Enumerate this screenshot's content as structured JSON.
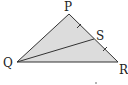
{
  "diagram": {
    "labels": {
      "P": "P",
      "Q": "Q",
      "R": "R",
      "S": "S"
    },
    "points": {
      "P": [
        69,
        14
      ],
      "Q": [
        17,
        62
      ],
      "R": [
        118,
        62
      ],
      "S": [
        94,
        39
      ]
    },
    "segments": [
      [
        "P",
        "Q"
      ],
      [
        "Q",
        "R"
      ],
      [
        "R",
        "P"
      ],
      [
        "Q",
        "S"
      ]
    ],
    "equal_marks": [
      [
        "P",
        "S"
      ],
      [
        "S",
        "R"
      ]
    ],
    "fill_color": "#dcdcdc",
    "stroke_color": "#333333"
  }
}
